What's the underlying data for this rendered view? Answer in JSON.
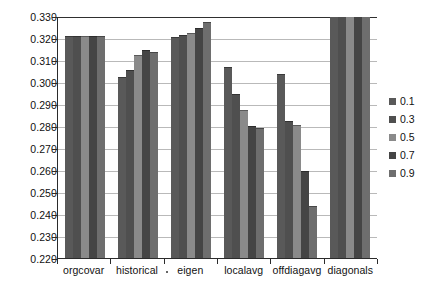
{
  "chart_data": {
    "type": "bar",
    "title": "",
    "subtitle": "",
    "xlabel": "",
    "ylabel": "",
    "ylim": [
      0.22,
      0.33
    ],
    "ytick_step": 0.01,
    "ytick_labels": [
      "0.330",
      "0.320",
      "0.310",
      "0.300",
      "0.290",
      "0.280",
      "0.270",
      "0.260",
      "0.250",
      "0.240",
      "0.230",
      "0.220"
    ],
    "ytick_values": [
      0.33,
      0.32,
      0.31,
      0.3,
      0.29,
      0.28,
      0.27,
      0.26,
      0.25,
      0.24,
      0.23,
      0.22
    ],
    "grid": true,
    "grid_axis": "y",
    "legend_position": "right",
    "legend_title": "",
    "categories": [
      "orgcovar",
      "historical",
      "eigen",
      "localavg",
      "offdiagavg",
      "diagonals"
    ],
    "category_separator_dot": "·",
    "series": [
      {
        "name": "0.1",
        "color": "#595959",
        "values": [
          0.321,
          0.3025,
          0.3205,
          0.307,
          0.3035,
          0.335
        ]
      },
      {
        "name": "0.3",
        "color": "#4f4f4f",
        "values": [
          0.321,
          0.3055,
          0.3215,
          0.2945,
          0.2825,
          0.335
        ]
      },
      {
        "name": "0.5",
        "color": "#8a8a8a",
        "values": [
          0.321,
          0.3125,
          0.3225,
          0.2875,
          0.2805,
          0.335
        ]
      },
      {
        "name": "0.7",
        "color": "#454545",
        "values": [
          0.321,
          0.3145,
          0.3245,
          0.28,
          0.2595,
          0.335
        ]
      },
      {
        "name": "0.9",
        "color": "#6e6e6e",
        "values": [
          0.321,
          0.3135,
          0.3275,
          0.279,
          0.2435,
          0.335
        ]
      }
    ]
  },
  "legend": {
    "items": [
      {
        "label": "0.1",
        "color": "#595959"
      },
      {
        "label": "0.3",
        "color": "#4f4f4f"
      },
      {
        "label": "0.5",
        "color": "#8a8a8a"
      },
      {
        "label": "0.7",
        "color": "#454545"
      },
      {
        "label": "0.9",
        "color": "#6e6e6e"
      }
    ]
  },
  "colors": {
    "axis": "#2b2b2b",
    "grid": "#b9b9b9",
    "text": "#111111",
    "background": "#ffffff"
  }
}
